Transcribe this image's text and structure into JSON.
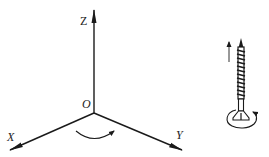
{
  "diagram": {
    "axes": {
      "z": {
        "label": "Z"
      },
      "x": {
        "label": "X"
      },
      "y": {
        "label": "Y"
      },
      "origin": {
        "label": "O"
      }
    },
    "rotation_arrow": {
      "direction": "clockwise-from-X-to-Y"
    },
    "screw": {
      "translation_arrow": "up",
      "rotation_arrow": "around-head"
    },
    "colors": {
      "line": "#1a1a1a",
      "background": "#ffffff"
    }
  }
}
